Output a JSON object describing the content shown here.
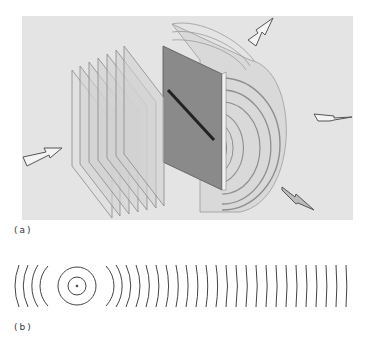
{
  "figure": {
    "part_a": {
      "label": "(a)",
      "description": "Plane waves incident on a slit produce cylindrical diffracted waves",
      "incident_plane_count": 6,
      "cylindrical_wavefront_count": 6,
      "arrows": [
        "incident-arrow",
        "diffracted-arrow-up",
        "diffracted-arrow-right",
        "diffracted-arrow-down"
      ]
    },
    "part_b": {
      "label": "(b)",
      "description": "Circular wavefronts from a point source becoming nearly planar with distance",
      "source": {
        "x": 77,
        "y": 286
      },
      "wavefront_spacing_px": 10,
      "circle_count": 2,
      "arc_count_right": 27,
      "arc_count_left": 4
    }
  },
  "colors": {
    "panel_bg": "#e4e4e4",
    "line": "#444444",
    "slit_screen": "#8a8a8a"
  }
}
